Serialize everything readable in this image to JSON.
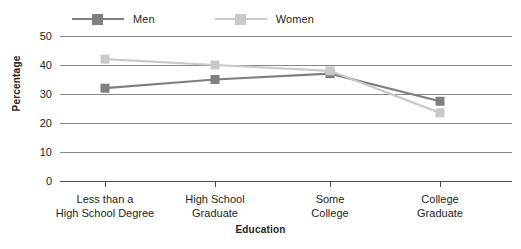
{
  "chart_data": {
    "type": "line",
    "title": "",
    "xlabel": "Education",
    "ylabel": "Percentage",
    "categories": [
      "Less than a\nHigh School Degree",
      "High School\nGraduate",
      "Some\nCollege",
      "College\nGraduate"
    ],
    "category_lines": [
      [
        "Less than a",
        "High School Degree"
      ],
      [
        "High School",
        "Graduate"
      ],
      [
        "Some",
        "College"
      ],
      [
        "College",
        "Graduate"
      ]
    ],
    "series": [
      {
        "name": "Men",
        "color": "#7f7f7f",
        "values": [
          32,
          35,
          37,
          27.5
        ]
      },
      {
        "name": "Women",
        "color": "#c9c9c9",
        "values": [
          42,
          40,
          38,
          23.5
        ]
      }
    ],
    "ylim": [
      0,
      50
    ],
    "yticks": [
      50,
      40,
      30,
      20,
      10,
      0
    ],
    "ytick_labels": [
      "50",
      "40",
      "30",
      "20",
      "10",
      "0"
    ],
    "grid": true,
    "legend_position": "top-left",
    "marker": "square"
  },
  "legend": {
    "items": [
      {
        "label": "Men",
        "color": "#7f7f7f"
      },
      {
        "label": "Women",
        "color": "#c9c9c9"
      }
    ]
  },
  "axes": {
    "y_title": "Percentage",
    "x_title": "Education"
  }
}
